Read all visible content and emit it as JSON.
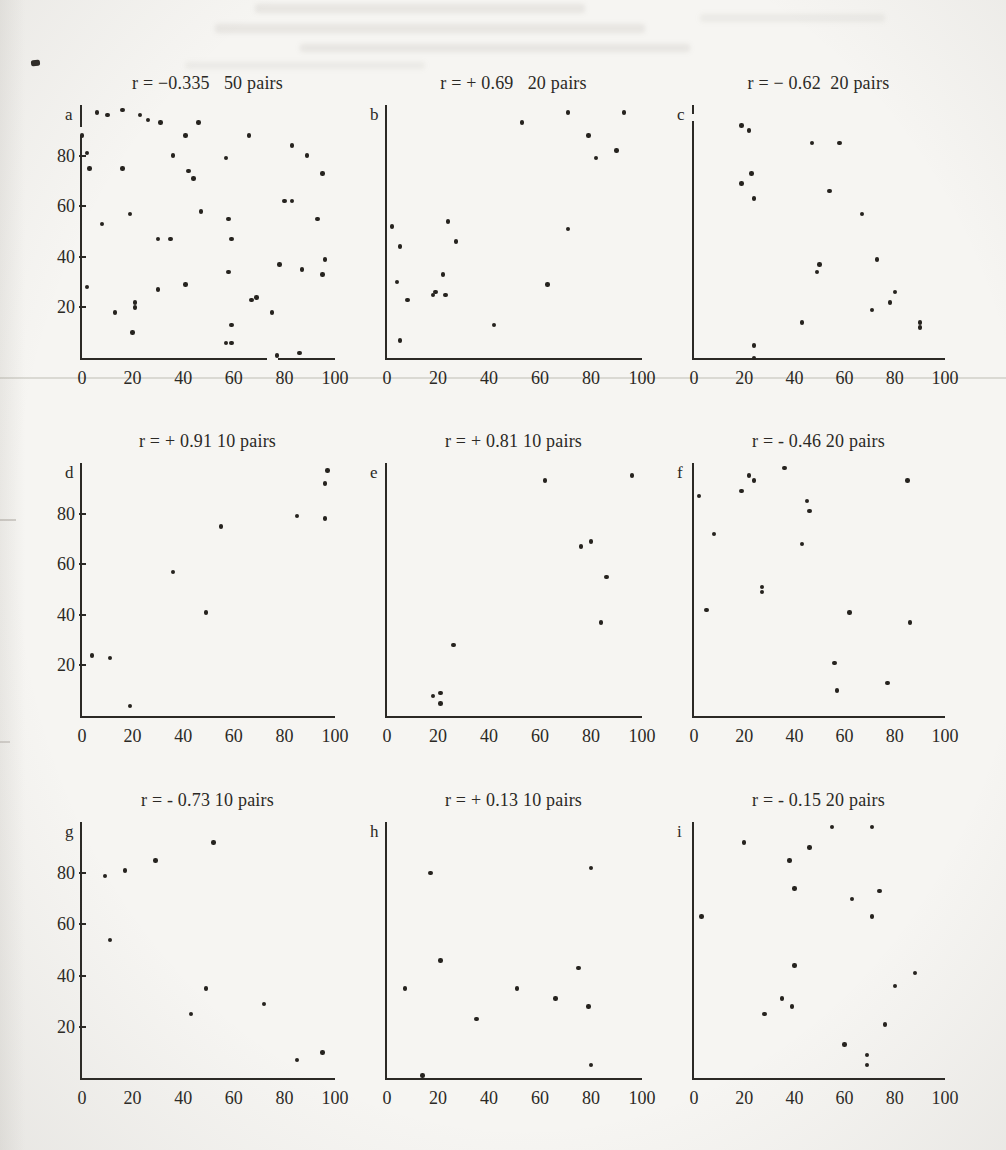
{
  "page": {
    "paper_color": "#f6f5f2",
    "ink_color": "#2b2925"
  },
  "chart_data": [
    {
      "type": "scatter",
      "label": "a",
      "title": "r = −0.335   50 pairs",
      "r": -0.335,
      "pairs": 50,
      "xlim": [
        0,
        100
      ],
      "ylim": [
        0,
        100
      ],
      "grid": false,
      "x_ticks": [
        "0",
        "20",
        "40",
        "60",
        "80",
        "100"
      ],
      "y_ticks": [
        "20",
        "40",
        "60",
        "80"
      ],
      "points": [
        [
          0,
          88
        ],
        [
          2,
          81
        ],
        [
          3,
          75
        ],
        [
          8,
          53
        ],
        [
          2,
          28
        ],
        [
          6,
          97
        ],
        [
          10,
          96
        ],
        [
          16,
          98
        ],
        [
          13,
          18
        ],
        [
          16,
          75
        ],
        [
          19,
          57
        ],
        [
          20,
          10
        ],
        [
          21,
          22
        ],
        [
          21,
          20
        ],
        [
          23,
          96
        ],
        [
          26,
          94
        ],
        [
          30,
          47
        ],
        [
          30,
          27
        ],
        [
          31,
          93
        ],
        [
          35,
          47
        ],
        [
          36,
          80
        ],
        [
          41,
          29
        ],
        [
          41,
          88
        ],
        [
          42,
          74
        ],
        [
          44,
          71
        ],
        [
          46,
          93
        ],
        [
          47,
          58
        ],
        [
          57,
          79
        ],
        [
          58,
          55
        ],
        [
          59,
          47
        ],
        [
          58,
          34
        ],
        [
          59,
          13
        ],
        [
          57,
          6
        ],
        [
          59,
          6
        ],
        [
          66,
          88
        ],
        [
          67,
          23
        ],
        [
          69,
          24
        ],
        [
          75,
          18
        ],
        [
          77,
          1
        ],
        [
          78,
          37
        ],
        [
          80,
          62
        ],
        [
          83,
          62
        ],
        [
          83,
          84
        ],
        [
          89,
          80
        ],
        [
          87,
          35
        ],
        [
          86,
          2
        ],
        [
          93,
          55
        ],
        [
          95,
          73
        ],
        [
          96,
          39
        ],
        [
          95,
          33
        ]
      ]
    },
    {
      "type": "scatter",
      "label": "b",
      "title": "r = + 0.69   20 pairs",
      "r": 0.69,
      "pairs": 20,
      "xlim": [
        0,
        100
      ],
      "ylim": [
        0,
        100
      ],
      "grid": false,
      "x_ticks": [
        "0",
        "20",
        "40",
        "60",
        "80",
        "100"
      ],
      "y_ticks": [],
      "points": [
        [
          2,
          52
        ],
        [
          5,
          44
        ],
        [
          4,
          30
        ],
        [
          8,
          23
        ],
        [
          5,
          7
        ],
        [
          18,
          25
        ],
        [
          19,
          26
        ],
        [
          23,
          25
        ],
        [
          22,
          33
        ],
        [
          24,
          54
        ],
        [
          27,
          46
        ],
        [
          42,
          13
        ],
        [
          53,
          93
        ],
        [
          63,
          29
        ],
        [
          71,
          97
        ],
        [
          71,
          51
        ],
        [
          79,
          88
        ],
        [
          82,
          79
        ],
        [
          90,
          82
        ],
        [
          93,
          97
        ]
      ]
    },
    {
      "type": "scatter",
      "label": "c",
      "title": "r = − 0.62  20 pairs",
      "r": -0.62,
      "pairs": 20,
      "xlim": [
        0,
        100
      ],
      "ylim": [
        0,
        100
      ],
      "grid": false,
      "x_ticks": [
        "0",
        "20",
        "40",
        "60",
        "80",
        "100"
      ],
      "y_ticks": [],
      "points": [
        [
          19,
          92
        ],
        [
          22,
          90
        ],
        [
          47,
          85
        ],
        [
          58,
          85
        ],
        [
          23,
          73
        ],
        [
          19,
          69
        ],
        [
          24,
          63
        ],
        [
          54,
          66
        ],
        [
          67,
          57
        ],
        [
          73,
          39
        ],
        [
          50,
          37
        ],
        [
          49,
          34
        ],
        [
          80,
          26
        ],
        [
          78,
          22
        ],
        [
          71,
          19
        ],
        [
          90,
          14
        ],
        [
          90,
          12
        ],
        [
          43,
          14
        ],
        [
          24,
          5
        ],
        [
          24,
          0
        ]
      ]
    },
    {
      "type": "scatter",
      "label": "d",
      "title": "r = + 0.91 10 pairs",
      "r": 0.91,
      "pairs": 10,
      "xlim": [
        0,
        100
      ],
      "ylim": [
        0,
        100
      ],
      "grid": false,
      "x_ticks": [
        "0",
        "20",
        "40",
        "60",
        "80",
        "100"
      ],
      "y_ticks": [
        "20",
        "40",
        "60",
        "80"
      ],
      "points": [
        [
          4,
          24
        ],
        [
          11,
          23
        ],
        [
          19,
          4
        ],
        [
          36,
          57
        ],
        [
          49,
          41
        ],
        [
          55,
          75
        ],
        [
          85,
          79
        ],
        [
          96,
          92
        ],
        [
          97,
          97
        ],
        [
          96,
          78
        ]
      ]
    },
    {
      "type": "scatter",
      "label": "e",
      "title": "r = + 0.81 10 pairs",
      "r": 0.81,
      "pairs": 10,
      "xlim": [
        0,
        100
      ],
      "ylim": [
        0,
        100
      ],
      "grid": false,
      "x_ticks": [
        "0",
        "20",
        "40",
        "60",
        "80",
        "100"
      ],
      "y_ticks": [],
      "points": [
        [
          62,
          93
        ],
        [
          96,
          95
        ],
        [
          76,
          67
        ],
        [
          80,
          69
        ],
        [
          86,
          55
        ],
        [
          84,
          37
        ],
        [
          26,
          28
        ],
        [
          21,
          9
        ],
        [
          18,
          8
        ],
        [
          21,
          5
        ]
      ]
    },
    {
      "type": "scatter",
      "label": "f",
      "title": "r = - 0.46 20 pairs",
      "r": -0.46,
      "pairs": 20,
      "xlim": [
        0,
        100
      ],
      "ylim": [
        0,
        100
      ],
      "grid": false,
      "x_ticks": [
        "0",
        "20",
        "40",
        "60",
        "80",
        "100"
      ],
      "y_ticks": [],
      "points": [
        [
          2,
          87
        ],
        [
          8,
          72
        ],
        [
          19,
          89
        ],
        [
          22,
          95
        ],
        [
          24,
          93
        ],
        [
          36,
          98
        ],
        [
          45,
          85
        ],
        [
          46,
          81
        ],
        [
          43,
          68
        ],
        [
          27,
          51
        ],
        [
          27,
          49
        ],
        [
          5,
          42
        ],
        [
          62,
          41
        ],
        [
          85,
          93
        ],
        [
          86,
          37
        ],
        [
          56,
          21
        ],
        [
          77,
          13
        ],
        [
          57,
          10
        ]
      ]
    },
    {
      "type": "scatter",
      "label": "g",
      "title": "r = - 0.73 10 pairs",
      "r": -0.73,
      "pairs": 10,
      "xlim": [
        0,
        100
      ],
      "ylim": [
        0,
        100
      ],
      "grid": false,
      "x_ticks": [
        "0",
        "20",
        "40",
        "60",
        "80",
        "100"
      ],
      "y_ticks": [
        "20",
        "40",
        "60",
        "80"
      ],
      "points": [
        [
          9,
          79
        ],
        [
          17,
          81
        ],
        [
          29,
          85
        ],
        [
          52,
          92
        ],
        [
          11,
          54
        ],
        [
          43,
          25
        ],
        [
          49,
          35
        ],
        [
          72,
          29
        ],
        [
          85,
          7
        ],
        [
          95,
          10
        ]
      ]
    },
    {
      "type": "scatter",
      "label": "h",
      "title": "r = + 0.13 10 pairs",
      "r": 0.13,
      "pairs": 10,
      "xlim": [
        0,
        100
      ],
      "ylim": [
        0,
        100
      ],
      "grid": false,
      "x_ticks": [
        "0",
        "20",
        "40",
        "60",
        "80",
        "100"
      ],
      "y_ticks": [],
      "points": [
        [
          17,
          80
        ],
        [
          80,
          82
        ],
        [
          21,
          46
        ],
        [
          75,
          43
        ],
        [
          7,
          35
        ],
        [
          51,
          35
        ],
        [
          66,
          31
        ],
        [
          79,
          28
        ],
        [
          35,
          23
        ],
        [
          80,
          5
        ],
        [
          14,
          1
        ]
      ]
    },
    {
      "type": "scatter",
      "label": "i",
      "title": "r = - 0.15 20 pairs",
      "r": -0.15,
      "pairs": 20,
      "xlim": [
        0,
        100
      ],
      "ylim": [
        0,
        100
      ],
      "grid": false,
      "x_ticks": [
        "0",
        "20",
        "40",
        "60",
        "80",
        "100"
      ],
      "y_ticks": [],
      "points": [
        [
          55,
          98
        ],
        [
          71,
          98
        ],
        [
          20,
          92
        ],
        [
          46,
          90
        ],
        [
          38,
          85
        ],
        [
          40,
          74
        ],
        [
          74,
          73
        ],
        [
          63,
          70
        ],
        [
          3,
          63
        ],
        [
          71,
          63
        ],
        [
          40,
          44
        ],
        [
          88,
          41
        ],
        [
          80,
          36
        ],
        [
          35,
          31
        ],
        [
          39,
          28
        ],
        [
          28,
          25
        ],
        [
          76,
          21
        ],
        [
          60,
          13
        ],
        [
          69,
          9
        ],
        [
          69,
          5
        ]
      ]
    }
  ]
}
